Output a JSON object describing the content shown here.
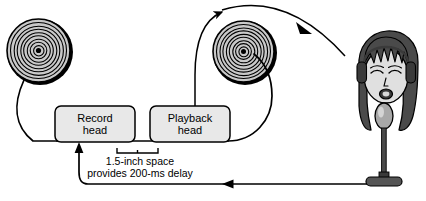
{
  "figure": {
    "type": "delayed-auditory-feedback-tape-loop-diagram",
    "background_color": "#ffffff",
    "line_color": "#000000",
    "box_fill_color": "#e8e8e8",
    "reel_fill_color": "#c9c9c9",
    "skin_fill_color": "#e0e0e0",
    "hair_fill_color": "#4a4a4a",
    "mic_fill_color": "#a8a8a8",
    "stand_fill_color": "#3a3a3a"
  },
  "boxes": {
    "record_head": {
      "label": "Record\nhead",
      "line1": "Record",
      "line2": "head"
    },
    "playback_head": {
      "label": "Playback\nhead",
      "line1": "Playback",
      "line2": "head"
    }
  },
  "caption": {
    "line1": "1.5-inch space",
    "line2": "provides 200-ms delay",
    "full": "1.5-inch space provides 200-ms delay",
    "distance": "1.5-inch",
    "delay": "200-ms"
  },
  "components": {
    "supply_reel": "tape-reel-left",
    "takeup_reel": "tape-reel-right",
    "listener": "person-with-headphones",
    "microphone": "microphone-on-stand"
  },
  "signal_flow": [
    {
      "id": "mic-to-record",
      "from": "microphone",
      "to": "record-head",
      "direction": "leftward-then-up"
    },
    {
      "id": "playback-to-headphones",
      "from": "playback-head",
      "to": "headphones",
      "direction": "rightward-arc"
    },
    {
      "id": "tape-to-takeup",
      "from": "tape-path",
      "to": "takeup-reel",
      "direction": "upward"
    }
  ]
}
